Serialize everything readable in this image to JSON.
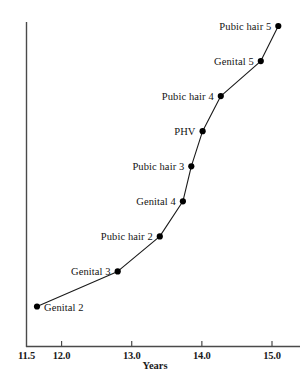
{
  "chart_data": {
    "type": "line",
    "title": "",
    "xlabel": "Years",
    "ylabel": "",
    "xlim": [
      11.5,
      15.3
    ],
    "ylim": [
      0,
      10
    ],
    "grid": false,
    "legend": null,
    "xticks": [
      {
        "value": 11.5,
        "label": "11.5"
      },
      {
        "value": 12.0,
        "label": "12.0"
      },
      {
        "value": 13.0,
        "label": "13.0"
      },
      {
        "value": 14.0,
        "label": "14.0"
      },
      {
        "value": 15.0,
        "label": "15.0"
      }
    ],
    "series": [
      {
        "name": "Pubertal milestones",
        "points": [
          {
            "label": "Genital 2",
            "x": 11.65,
            "y": 1,
            "label_side": "right"
          },
          {
            "label": "Genital 3",
            "x": 12.8,
            "y": 2,
            "label_side": "left"
          },
          {
            "label": "Pubic hair 2",
            "x": 13.4,
            "y": 3,
            "label_side": "left"
          },
          {
            "label": "Genital 4",
            "x": 13.73,
            "y": 4,
            "label_side": "left"
          },
          {
            "label": "Pubic hair 3",
            "x": 13.85,
            "y": 5,
            "label_side": "left"
          },
          {
            "label": "PHV",
            "x": 14.01,
            "y": 6,
            "label_side": "left"
          },
          {
            "label": "Pubic hair 4",
            "x": 14.27,
            "y": 7,
            "label_side": "left"
          },
          {
            "label": "Genital 5",
            "x": 14.84,
            "y": 8,
            "label_side": "left"
          },
          {
            "label": "Pubic hair 5",
            "x": 15.09,
            "y": 9,
            "label_side": "left"
          }
        ]
      }
    ],
    "colors": {
      "line": "#1a1a1a",
      "marker": "#000000",
      "axis": "#1a1a1a",
      "background": "#ffffff",
      "text": "#141414"
    }
  }
}
